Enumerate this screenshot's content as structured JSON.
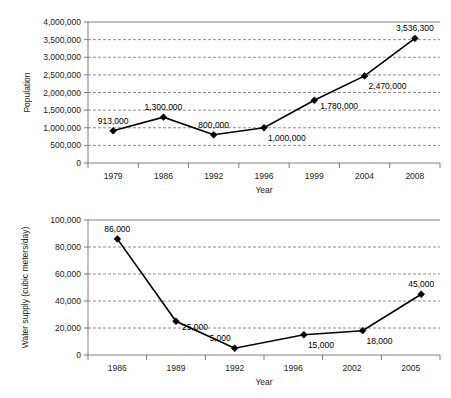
{
  "chart_data": [
    {
      "id": "population",
      "type": "line",
      "title": "",
      "xlabel": "Year",
      "ylabel": "Population",
      "categories": [
        "1979",
        "1986",
        "1992",
        "1996",
        "1999",
        "2004",
        "2008"
      ],
      "values": [
        913000,
        1300000,
        800000,
        1000000,
        1780000,
        2470000,
        3536300
      ],
      "point_labels": [
        "913,000",
        "1,300,000",
        "800,000",
        "1,000,000",
        "1,780,000",
        "2,470,000",
        "3,536,300"
      ],
      "label_positions": [
        "above",
        "above",
        "above",
        "below-right",
        "right",
        "below-right",
        "above"
      ],
      "ylim": [
        0,
        4000000
      ],
      "ytick_values": [
        0,
        500000,
        1000000,
        1500000,
        2000000,
        2500000,
        3000000,
        3500000,
        4000000
      ],
      "ytick_labels": [
        "0",
        "500,000",
        "1,000,000",
        "1,500,000",
        "2,000,000",
        "2,500,000",
        "3,000,000",
        "3,500,000",
        "4,000,000"
      ],
      "grid": true,
      "legend": "none",
      "marker": "diamond",
      "line_color": "#000000"
    },
    {
      "id": "water-supply",
      "type": "line",
      "title": "",
      "xlabel": "Year",
      "ylabel": "Water supply (cubic meters/day)",
      "categories": [
        "1986",
        "1989",
        "1992",
        "1996",
        "2002",
        "2005"
      ],
      "values": [
        86000,
        25000,
        5000,
        15000,
        18000,
        45000
      ],
      "point_labels": [
        "86,000",
        "25,000",
        "5,000",
        "15,000",
        "18,000",
        "45,000"
      ],
      "label_positions": [
        "above",
        "right",
        "above-right",
        "below-right",
        "below-right",
        "above"
      ],
      "point_offsets": [
        0,
        0,
        0,
        0.18,
        0.18,
        0.18
      ],
      "ylim": [
        0,
        100000
      ],
      "ytick_values": [
        0,
        20000,
        40000,
        60000,
        80000,
        100000
      ],
      "ytick_labels": [
        "0",
        "20,000",
        "40,000",
        "60,000",
        "80,000",
        "100,000"
      ],
      "grid": true,
      "legend": "none",
      "marker": "diamond",
      "line_color": "#000000"
    }
  ]
}
